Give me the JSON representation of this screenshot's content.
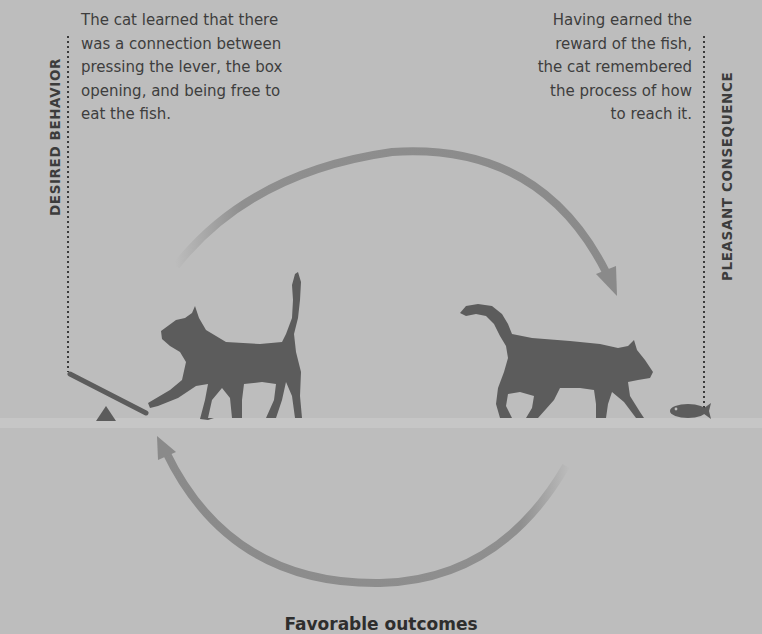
{
  "left_panel": {
    "label": "DESIRED BEHAVIOR",
    "text_lines": [
      "The cat learned that there",
      "was a connection between",
      "pressing the lever, the box",
      "opening, and being free to",
      "eat the fish."
    ]
  },
  "right_panel": {
    "label": "PLEASANT CONSEQUENCE",
    "text_lines": [
      "Having earned the",
      "reward of the fish,",
      "the cat remembered",
      "the process of how",
      "to reach it."
    ]
  },
  "caption": "Favorable outcomes",
  "icons": [
    "lever-icon",
    "fulcrum-icon",
    "cat-pressing-lever-icon",
    "cat-walking-icon",
    "fish-icon",
    "cycle-arrow-top",
    "cycle-arrow-bottom"
  ],
  "colors": {
    "background": "#bdbdbd",
    "silhouette": "#5c5c5c",
    "arrow": "#8a8a8a",
    "text": "#3e3e3e"
  }
}
